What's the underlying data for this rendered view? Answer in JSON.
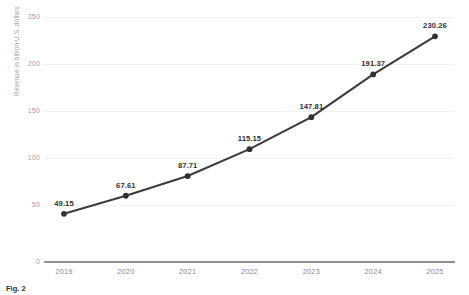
{
  "chart_data": {
    "type": "line",
    "title": "",
    "xlabel": "",
    "ylabel": "Revenue in billion U.S. dollars",
    "categories": [
      "2019",
      "2020",
      "2021",
      "2022",
      "2023",
      "2024",
      "2025"
    ],
    "values": [
      49.15,
      67.61,
      87.71,
      115.15,
      147.81,
      191.37,
      230.26
    ],
    "point_labels": [
      "49.15",
      "67.61",
      "87.71",
      "115.15",
      "147.81",
      "191.37",
      "230.26"
    ],
    "ylim": [
      0,
      250
    ],
    "yticks": [
      250,
      200,
      150,
      100,
      50,
      0
    ],
    "ytick_labels": [
      "250",
      "200",
      "150",
      "100",
      "50",
      "0"
    ],
    "grid": true,
    "legend": "none",
    "series": [
      {
        "name": "Revenue",
        "values": [
          49.15,
          67.61,
          87.71,
          115.15,
          147.81,
          191.37,
          230.26
        ],
        "color": "#3a3c3e",
        "marker": "circle"
      }
    ],
    "colors": {
      "line": "#3a3c3e",
      "marker": "#2f3133",
      "gridline": "#eef0f1",
      "axis": "#8e9193",
      "tick_text": "#9b9ea0",
      "label_text": "#2f3133",
      "background": "#ffffff"
    }
  },
  "caption": {
    "lead": "Fig. 2",
    "rest": ""
  }
}
